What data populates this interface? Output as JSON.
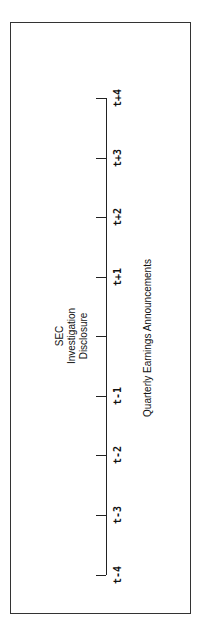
{
  "diagram": {
    "event_label": [
      "SEC",
      "Investigation",
      "Disclosure"
    ],
    "axis_label": "Quarterly Earnings Announcements",
    "ticks": [
      {
        "label": "t+4",
        "y": 98
      },
      {
        "label": "t+3",
        "y": 158
      },
      {
        "label": "t+2",
        "y": 217
      },
      {
        "label": "t+1",
        "y": 277
      },
      {
        "label": "",
        "y": 336
      },
      {
        "label": "t-1",
        "y": 396
      },
      {
        "label": "t-2",
        "y": 455
      },
      {
        "label": "t-3",
        "y": 515
      },
      {
        "label": "t-4",
        "y": 575
      }
    ]
  }
}
